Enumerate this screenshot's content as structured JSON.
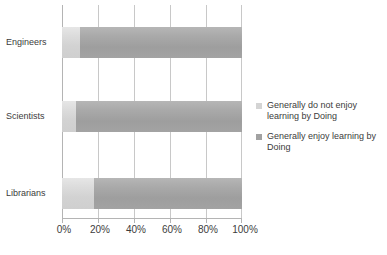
{
  "chart_data": {
    "type": "bar",
    "orientation": "horizontal",
    "stacked": true,
    "normalized_percent": true,
    "title": "",
    "subtitle": "",
    "xlabel": "",
    "ylabel": "",
    "categories": [
      "Engineers",
      "Scientists",
      "Librarians"
    ],
    "series": [
      {
        "name": "Generally do not enjoy learning by Doing",
        "color": "#d4d4d4",
        "values": [
          10,
          8,
          18
        ]
      },
      {
        "name": "Generally enjoy learning by Doing",
        "color": "#a2a2a2",
        "values": [
          90,
          92,
          82
        ]
      }
    ],
    "xlim": [
      0,
      100
    ],
    "xticks": [
      0,
      20,
      40,
      60,
      80,
      100
    ],
    "xticklabels": [
      "0%",
      "20%",
      "40%",
      "60%",
      "80%",
      "100%"
    ],
    "grid": true,
    "grid_axis": "x",
    "legend_position": "right"
  },
  "legend": {
    "items": [
      {
        "label_line1": "Generally do not enjoy",
        "label_line2": "learning by Doing",
        "swatch": "light"
      },
      {
        "label_line1": "Generally enjoy learning",
        "label_line2": "by Doing",
        "swatch": "dark"
      }
    ]
  },
  "colors": {
    "series_light": "#d4d4d4",
    "series_dark": "#a2a2a2",
    "gridline": "#c8c8c8",
    "axis": "#b4b4b4",
    "text": "#3c3c3c",
    "background": "#ffffff"
  }
}
